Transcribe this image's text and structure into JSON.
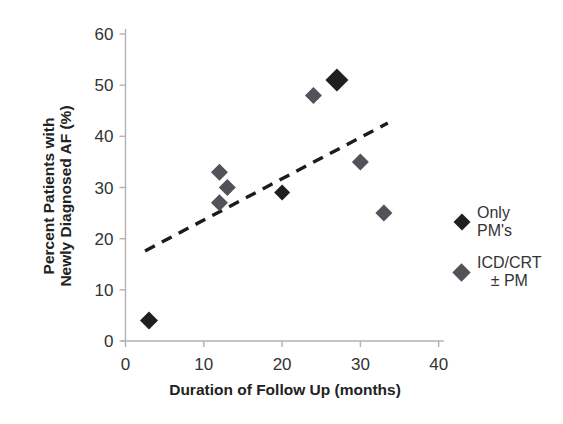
{
  "figure": {
    "width_px": 563,
    "height_px": 424,
    "background": "#ffffff"
  },
  "chart_data": {
    "type": "scatter",
    "title": "",
    "xlabel": "Duration of Follow Up (months)",
    "ylabel_line1": "Percent Patients with",
    "ylabel_line2": "Newly Diagnosed AF (%)",
    "xlim": [
      0,
      40
    ],
    "ylim": [
      0,
      60
    ],
    "xticks": [
      0,
      10,
      20,
      30,
      40
    ],
    "yticks": [
      0,
      10,
      20,
      30,
      40,
      50,
      60
    ],
    "grid": false,
    "legend_position": "right",
    "axis_color": "#b5b2af",
    "tick_text_color": "#333333",
    "series": [
      {
        "name": "Only PM's",
        "legend_line1": "Only",
        "legend_line2": "PM's",
        "color": "#1f1f22",
        "marker": "diamond",
        "marker_half_px": 8.5,
        "points": [
          {
            "x": 3,
            "y": 4,
            "px": 9
          },
          {
            "x": 20,
            "y": 29,
            "px": 8
          },
          {
            "x": 27,
            "y": 51,
            "px": 11.5
          }
        ]
      },
      {
        "name": "ICD/CRT ± PM",
        "legend_line1": "ICD/CRT",
        "legend_line2": "± PM",
        "color": "#515358",
        "marker": "diamond",
        "marker_half_px": 8.5,
        "points": [
          {
            "x": 12,
            "y": 33
          },
          {
            "x": 13,
            "y": 30
          },
          {
            "x": 12,
            "y": 27
          },
          {
            "x": 24,
            "y": 48
          },
          {
            "x": 30,
            "y": 35
          },
          {
            "x": 33,
            "y": 25
          }
        ]
      }
    ],
    "trendline": {
      "style": "dashed",
      "color": "#1c1c1c",
      "x1": 2.5,
      "y1": 17.6,
      "x2": 33.5,
      "y2": 42.6
    }
  }
}
